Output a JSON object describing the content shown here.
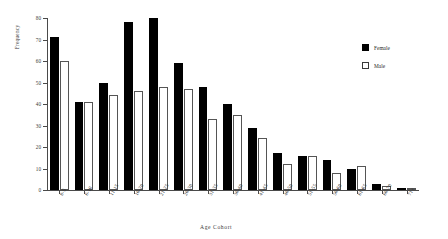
{
  "chart_data": {
    "type": "bar",
    "title": "",
    "xlabel": "Age  Cohort",
    "ylabel": "Frequency",
    "ylim": [
      0,
      80
    ],
    "yticks": [
      0,
      10,
      20,
      30,
      40,
      50,
      60,
      70,
      80
    ],
    "grid": false,
    "legend_position": "top-right",
    "categories": [
      "0-5",
      "6-10",
      "11-15",
      "16-20",
      "21-25",
      "26-30",
      "31-35",
      "36-40",
      "41-45",
      "46-50",
      "51-55",
      "56-60",
      "61-65",
      "66-70",
      "71+"
    ],
    "series": [
      {
        "name": "Female",
        "color": "#000000",
        "values": [
          71,
          41,
          50,
          78,
          80,
          59,
          48,
          40,
          29,
          17,
          16,
          14,
          10,
          3,
          1
        ]
      },
      {
        "name": "Male",
        "color": "#ffffff",
        "values": [
          60,
          41,
          44,
          46,
          48,
          47,
          33,
          35,
          24,
          12,
          16,
          8,
          11,
          2,
          1
        ]
      }
    ]
  },
  "legend": {
    "items": [
      {
        "label": "Female",
        "swatch": "filled-black-square"
      },
      {
        "label": "Male",
        "swatch": "outlined-white-square"
      }
    ]
  }
}
